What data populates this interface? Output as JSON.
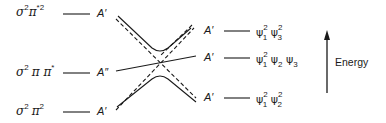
{
  "diagram": {
    "type": "orbital-correlation-diagram",
    "axis": {
      "label": "Energy",
      "direction": "up"
    },
    "left_states": [
      {
        "config": {
          "base1": "σ",
          "sup1": "2",
          "base2": "π",
          "sup2": "*2"
        },
        "symmetry": "A′"
      },
      {
        "config": {
          "base1": "σ",
          "sup1": "2",
          "base2": "π π",
          "sup2": "*"
        },
        "symmetry": "A″"
      },
      {
        "config": {
          "base1": "σ",
          "sup1": "2",
          "base2": "π",
          "sup2": "2"
        },
        "symmetry": "A′"
      }
    ],
    "right_states": [
      {
        "symmetry": "A′",
        "config": [
          {
            "psi": "ψ",
            "sup": "2",
            "sub": "1"
          },
          {
            "psi": "ψ",
            "sup": "2",
            "sub": "3"
          }
        ]
      },
      {
        "symmetry": "A′",
        "config": [
          {
            "psi": "ψ",
            "sup": "2",
            "sub": "1"
          },
          {
            "psi": "ψ",
            "sup": "",
            "sub": "2"
          },
          {
            "psi": "ψ",
            "sup": "",
            "sub": "3"
          }
        ]
      },
      {
        "symmetry": "A′",
        "config": [
          {
            "psi": "ψ",
            "sup": "2",
            "sub": "1"
          },
          {
            "psi": "ψ",
            "sup": "2",
            "sub": "2"
          }
        ]
      }
    ],
    "colors": {
      "line": "#1a1a1a",
      "background": "#ffffff"
    }
  }
}
